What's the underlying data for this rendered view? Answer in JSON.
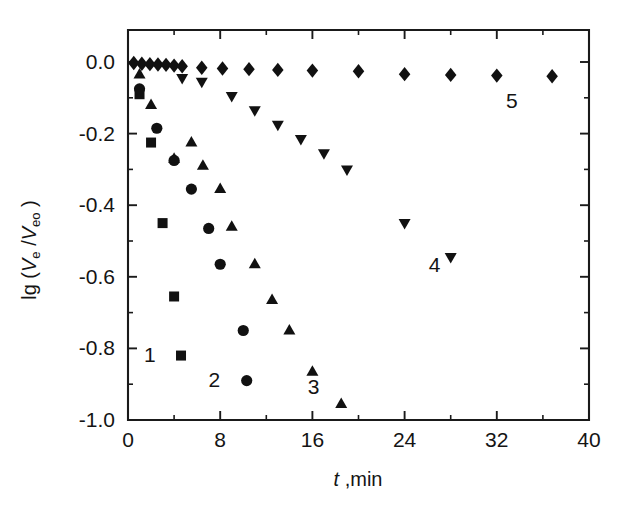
{
  "chart_data": {
    "type": "scatter",
    "title": "",
    "subtitle": "",
    "xlabel": "t ,min",
    "xlabel_italic_part": "t",
    "xlabel_rest": " ,min",
    "ylabel": "lg (Ve /Veo)",
    "ylabel_parts": {
      "lead": "lg (",
      "v1": "V",
      "sub1": "e",
      "mid": " /",
      "v2": "V",
      "sub2": "eo",
      "close": " )"
    },
    "xlim": [
      0,
      40
    ],
    "ylim": [
      -1.0,
      0.05
    ],
    "xticks": [
      0,
      8,
      16,
      24,
      32,
      40
    ],
    "xticklabels": [
      "0",
      "8",
      "16",
      "24",
      "32",
      "40"
    ],
    "xminorticks": [
      4,
      12,
      20,
      28,
      36
    ],
    "yticks": [
      0.0,
      -0.2,
      -0.4,
      -0.6,
      -0.8,
      -1.0
    ],
    "yticklabels": [
      "0.0",
      "-0.2",
      "-0.4",
      "-0.6",
      "-0.8",
      "-1.0"
    ],
    "yminorticks": [
      -0.1,
      -0.3,
      -0.5,
      -0.7,
      -0.9
    ],
    "grid": false,
    "legend_position": "inline-annotations",
    "series": [
      {
        "name": "1",
        "marker": "square",
        "label": "1",
        "label_x": 1.9,
        "label_y": -0.815,
        "x": [
          1.0,
          2.0,
          3.0,
          4.0,
          4.6
        ],
        "y": [
          -0.09,
          -0.225,
          -0.45,
          -0.655,
          -0.82
        ]
      },
      {
        "name": "2",
        "marker": "circle",
        "label": "2",
        "label_x": 7.5,
        "label_y": -0.885,
        "x": [
          1.0,
          2.5,
          4.0,
          5.5,
          7.0,
          8.0,
          10.0
        ],
        "y": [
          -0.075,
          -0.185,
          -0.275,
          -0.355,
          -0.465,
          -0.565,
          -0.75
        ],
        "x_extra": [
          10.3
        ],
        "y_extra": [
          -0.89
        ]
      },
      {
        "name": "3",
        "marker": "triangle-up",
        "label": "3",
        "label_x": 16.1,
        "label_y": -0.905,
        "x": [
          1.0,
          2.0,
          4.0,
          5.5,
          6.5,
          8.0,
          9.0,
          11.0,
          12.5,
          14.0,
          16.0,
          18.5
        ],
        "y": [
          -0.035,
          -0.12,
          -0.27,
          -0.225,
          -0.29,
          -0.355,
          -0.46,
          -0.565,
          -0.665,
          -0.75,
          -0.865,
          -0.955
        ]
      },
      {
        "name": "4",
        "marker": "triangle-down",
        "label": "4",
        "label_x": 26.6,
        "label_y": -0.565,
        "x": [
          4.7,
          6.4,
          9.0,
          11.0,
          13.0,
          15.0,
          17.0,
          19.0,
          24.0,
          28.0
        ],
        "y": [
          -0.045,
          -0.055,
          -0.095,
          -0.135,
          -0.175,
          -0.215,
          -0.255,
          -0.3,
          -0.45,
          -0.545
        ]
      },
      {
        "name": "5",
        "marker": "diamond",
        "label": "5",
        "label_x": 33.3,
        "label_y": -0.105,
        "x": [
          0.5,
          1.2,
          1.9,
          2.6,
          3.3,
          4.0,
          4.7,
          6.4,
          8.2,
          10.5,
          13.0,
          16.0,
          20.0,
          24.0,
          28.0,
          32.0,
          36.8
        ],
        "y": [
          -0.003,
          -0.005,
          -0.006,
          -0.007,
          -0.008,
          -0.01,
          -0.012,
          -0.016,
          -0.018,
          -0.02,
          -0.022,
          -0.024,
          -0.026,
          -0.034,
          -0.036,
          -0.038,
          -0.04
        ]
      }
    ],
    "marker_color": "#111111",
    "axis_color": "#1a1a1a",
    "background_color": "#ffffff"
  }
}
